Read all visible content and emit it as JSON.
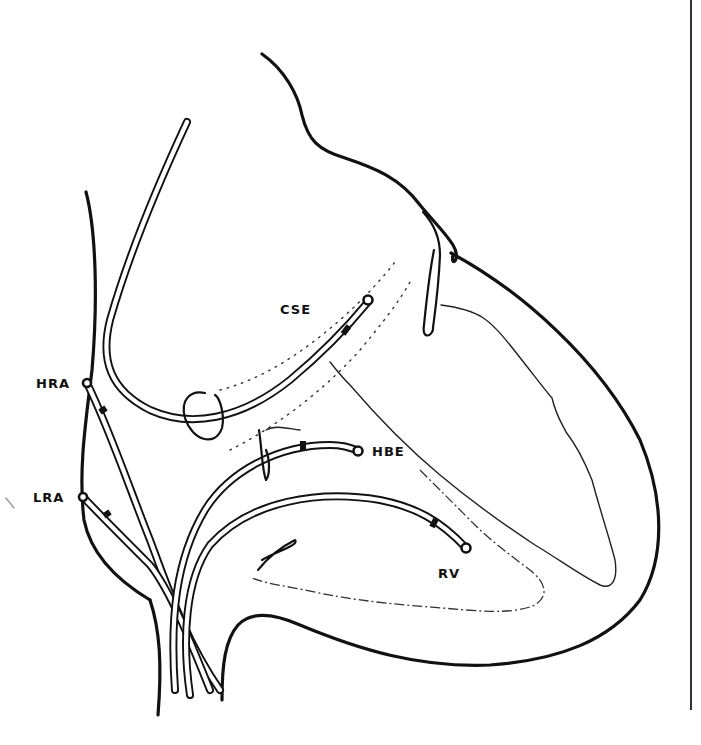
{
  "figure": {
    "type": "anatomical line drawing"
  },
  "labels": {
    "cse": "CSE",
    "hra": "HRA",
    "lra": "LRA",
    "hbe": "HBE",
    "rv": "RV"
  },
  "colors": {
    "line": "#111111",
    "background": "#ffffff",
    "right_rule": "#333333"
  }
}
